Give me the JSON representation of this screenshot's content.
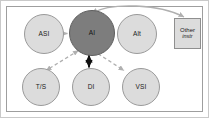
{
  "diagram": {
    "frame": {
      "outer_border_color": "#c9c9c9",
      "inner_border_color": "#9e9e9e",
      "background_color": "#ffffff"
    },
    "nodes": [
      {
        "id": "asi",
        "label": "ASI",
        "shape": "circle",
        "role": "secondary",
        "fill": "#dcdcdc",
        "x": 24,
        "y": 14,
        "size": 40
      },
      {
        "id": "ai",
        "label": "AI",
        "shape": "circle",
        "role": "primary",
        "fill": "#7d7d7d",
        "x": 69,
        "y": 10,
        "size": 46
      },
      {
        "id": "alt",
        "label": "Alt",
        "shape": "circle",
        "role": "secondary",
        "fill": "#dcdcdc",
        "x": 117,
        "y": 14,
        "size": 40
      },
      {
        "id": "ts",
        "label": "T/S",
        "shape": "circle",
        "role": "secondary",
        "fill": "#dcdcdc",
        "x": 22,
        "y": 68,
        "size": 38
      },
      {
        "id": "di",
        "label": "DI",
        "shape": "circle",
        "role": "secondary",
        "fill": "#dcdcdc",
        "x": 72,
        "y": 68,
        "size": 38
      },
      {
        "id": "vsi",
        "label": "VSI",
        "shape": "circle",
        "role": "secondary",
        "fill": "#dcdcdc",
        "x": 122,
        "y": 68,
        "size": 38
      }
    ],
    "box_node": {
      "id": "other-instr",
      "line1": "Other",
      "line2": "instr",
      "fill": "#dcdcdc",
      "x": 174,
      "y": 18,
      "width": 27,
      "height": 31
    },
    "connectors": [
      {
        "id": "ai-asi",
        "from": "ai",
        "to": "asi",
        "style": "dashed",
        "arrow": "double",
        "color": "#b0b0b0"
      },
      {
        "id": "ai-alt",
        "from": "ai",
        "to": "alt",
        "style": "dashed",
        "arrow": "double",
        "color": "#b0b0b0"
      },
      {
        "id": "ai-ts",
        "from": "ai",
        "to": "ts",
        "style": "dashed",
        "arrow": "double",
        "color": "#b0b0b0"
      },
      {
        "id": "ai-di",
        "from": "ai",
        "to": "di",
        "style": "solid",
        "arrow": "double",
        "color": "#101010"
      },
      {
        "id": "ai-vsi",
        "from": "ai",
        "to": "vsi",
        "style": "dashed",
        "arrow": "double",
        "color": "#b0b0b0"
      },
      {
        "id": "ai-other-instr",
        "from": "ai",
        "to": "other-instr",
        "style": "curved",
        "arrow": "double",
        "color": "#b0b0b0"
      }
    ]
  }
}
